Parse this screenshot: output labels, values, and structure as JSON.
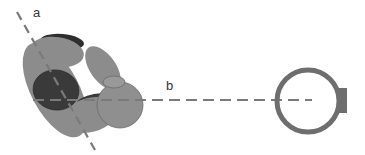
{
  "diagram": {
    "labels": {
      "axis_a": "a",
      "axis_b": "b"
    },
    "colors": {
      "background": "#ffffff",
      "body_grey": "#8c8c8c",
      "body_grey_light": "#999999",
      "dark_ellipse": "#3a3a3a",
      "cap_dark": "#2e2e2e",
      "axis_dash": "#7a7a7a",
      "ring": "#6e6e6e",
      "label_text": "#333333"
    },
    "elements": [
      {
        "name": "molecule-cluster",
        "description": "cluster of grey ellipses with a dark ellipse"
      },
      {
        "name": "axis-a",
        "description": "diagonal dashed axis through cluster"
      },
      {
        "name": "axis-b",
        "description": "horizontal dashed axis extending to ring"
      },
      {
        "name": "ring",
        "description": "open ring with small tab on right side"
      }
    ]
  }
}
